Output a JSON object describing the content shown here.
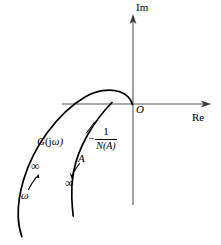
{
  "figure": {
    "type": "complex-plane-nyquist-describing-function-diagram",
    "background_color": "#ffffff",
    "curve_color": "#000000",
    "axis_color": "#888888"
  },
  "axes": {
    "imaginary_label": "Im",
    "real_label": "Re",
    "origin_label": "O",
    "origin_px": {
      "x": 133,
      "y": 104
    },
    "vertical_axis": {
      "x": 133,
      "top_y": 16,
      "bottom_y": 205
    },
    "horizontal_axis": {
      "y": 104,
      "left_x": 62,
      "right_x": 210
    }
  },
  "curves": [
    {
      "name": "G(jw)-locus",
      "label": "G(jω)",
      "label_italic_part": "G",
      "label_upright_part": "(j",
      "label_omega": "ω)",
      "direction_marker": "ω",
      "limit_marker": "∞",
      "description": "Frequency response locus, arcs above the real axis near the origin then sweeps down and to the left"
    },
    {
      "name": "negative-reciprocal-describing-function-locus",
      "label_minus": "−",
      "label_numerator": "1",
      "label_denominator": "N(A)",
      "direction_marker": "A",
      "limit_marker": "∞",
      "description": "Negative reciprocal of the describing function, starts on the real axis and curves downward"
    }
  ],
  "annotations": {
    "g_infinity": "∞",
    "g_omega": "ω",
    "a_label": "A",
    "a_infinity": "∞",
    "im_axis": "Im",
    "re_axis": "Re",
    "origin": "O"
  }
}
